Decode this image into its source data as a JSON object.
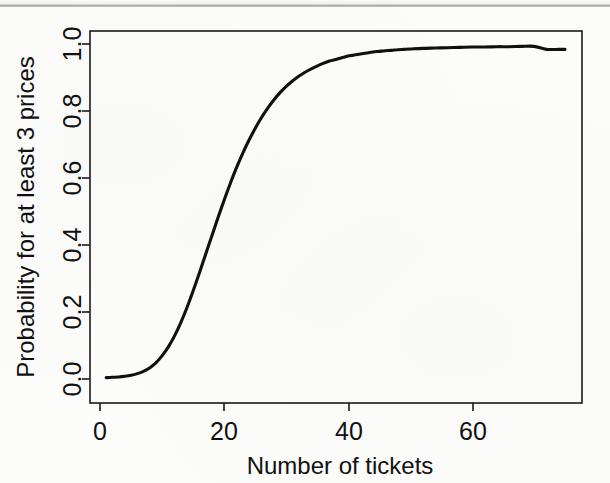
{
  "figure": {
    "background_color": "#fcfcfb",
    "ink_color": "#101010"
  },
  "chart_data": {
    "type": "line",
    "title": "",
    "subtitle": "",
    "xlabel": "Number of tickets",
    "ylabel": "Probability for at least 3 prices",
    "xlim": [
      1,
      75
    ],
    "ylim": [
      0.0,
      1.0
    ],
    "xticks": [
      0,
      20,
      40,
      60
    ],
    "xtick_labels": [
      "0",
      "20",
      "40",
      "60"
    ],
    "yticks": [
      0.0,
      0.2,
      0.4,
      0.6,
      0.8,
      1.0
    ],
    "ytick_labels": [
      "0.0",
      "0.2",
      "0.4",
      "0.6",
      "0.8",
      "1.0"
    ],
    "grid": false,
    "legend": null,
    "legend_position": "none",
    "box_frame": true,
    "annotations": [],
    "series": [
      {
        "name": "Probability for at least 3 prices",
        "color": "#101010",
        "line_width": 3,
        "x": [
          1,
          2,
          3,
          4,
          5,
          6,
          7,
          8,
          9,
          10,
          11,
          12,
          13,
          14,
          15,
          16,
          17,
          18,
          19,
          20,
          21,
          22,
          23,
          24,
          25,
          26,
          27,
          28,
          29,
          30,
          31,
          32,
          33,
          34,
          35,
          36,
          37,
          38,
          39,
          40,
          41,
          42,
          43,
          44,
          45,
          46,
          47,
          48,
          49,
          50,
          52,
          54,
          56,
          58,
          60,
          62,
          64,
          66,
          68,
          70,
          72,
          74,
          75
        ],
        "y": [
          0.004,
          0.005,
          0.006,
          0.008,
          0.011,
          0.016,
          0.023,
          0.033,
          0.048,
          0.069,
          0.095,
          0.128,
          0.167,
          0.212,
          0.262,
          0.315,
          0.37,
          0.425,
          0.48,
          0.533,
          0.583,
          0.63,
          0.673,
          0.712,
          0.747,
          0.779,
          0.807,
          0.832,
          0.854,
          0.873,
          0.889,
          0.903,
          0.915,
          0.925,
          0.934,
          0.942,
          0.949,
          0.954,
          0.959,
          0.964,
          0.967,
          0.97,
          0.973,
          0.976,
          0.978,
          0.98,
          0.981,
          0.983,
          0.984,
          0.985,
          0.987,
          0.988,
          0.989,
          0.99,
          0.991,
          0.991,
          0.992,
          0.992,
          0.993,
          0.993,
          0.984,
          0.984,
          0.984
        ]
      }
    ]
  }
}
